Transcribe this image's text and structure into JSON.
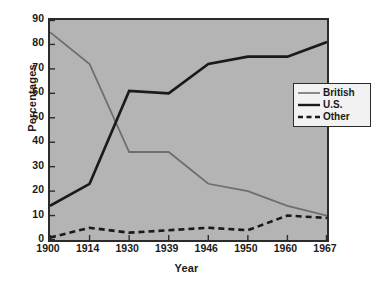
{
  "chart_data": {
    "type": "line",
    "title": "",
    "xlabel": "Year",
    "ylabel": "Percentages",
    "categories": [
      "1900",
      "1914",
      "1930",
      "1939",
      "1946",
      "1950",
      "1960",
      "1967"
    ],
    "ylim": [
      0,
      90
    ],
    "yticks": [
      "0",
      "10",
      "20",
      "30",
      "40",
      "50",
      "60",
      "70",
      "80",
      "90"
    ],
    "grid": false,
    "legend_position": "upper-right-inside",
    "plot_background": "#b4b4b4",
    "figure_background": "#ffffff",
    "axis_color": "#2b2b2b",
    "series": [
      {
        "name": "British",
        "color": "#6e6e6e",
        "style": "solid",
        "values": [
          85,
          72,
          36,
          36,
          23,
          20,
          14,
          10
        ]
      },
      {
        "name": "U.S.",
        "color": "#1a1a1a",
        "style": "solid",
        "values": [
          14,
          23,
          61,
          60,
          72,
          75,
          75,
          81
        ]
      },
      {
        "name": "Other",
        "color": "#1a1a1a",
        "style": "dashed",
        "values": [
          1,
          5,
          3,
          4,
          5,
          4,
          10,
          9
        ]
      }
    ]
  },
  "legend": {
    "items": [
      {
        "label": "British"
      },
      {
        "label": "U.S."
      },
      {
        "label": "Other"
      }
    ]
  }
}
